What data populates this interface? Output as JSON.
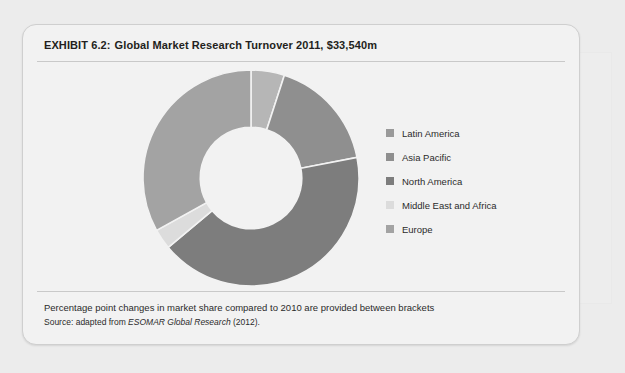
{
  "exhibit": {
    "label": "EXHIBIT 6.2:",
    "title": "Global Market Research Turnover 2011, $33,540m"
  },
  "legend": {
    "position": "right",
    "items": [
      {
        "label": "Latin America",
        "color": "#9a9a9a",
        "icon": "legend-swatch-icon"
      },
      {
        "label": "Asia Pacific",
        "color": "#8f8f8f",
        "icon": "legend-swatch-icon"
      },
      {
        "label": "North America",
        "color": "#7d7d7d",
        "icon": "legend-swatch-icon"
      },
      {
        "label": "Middle East and Africa",
        "color": "#dcdcdc",
        "icon": "legend-swatch-icon"
      },
      {
        "label": "Europe",
        "color": "#a3a3a3",
        "icon": "legend-swatch-icon"
      }
    ]
  },
  "footnotes": {
    "note": "Percentage point changes in market share compared to 2010 are provided between brackets",
    "source_prefix": "Source: adapted from ",
    "source_italic": "ESOMAR Global Research",
    "source_suffix": " (2012)."
  },
  "ghost_blocks": {
    "a": "",
    "b": "",
    "c": "",
    "d": "",
    "e": "",
    "f": ""
  },
  "chart_data": {
    "type": "pie",
    "variant": "donut",
    "title": "Global Market Research Turnover 2011, $33,540m",
    "total_label": "$33,540m",
    "inner_radius_ratio": 0.47,
    "start_angle_deg": 0,
    "direction": "clockwise",
    "grid": false,
    "legend_position": "right",
    "categories": [
      "Latin America",
      "Asia Pacific",
      "North America",
      "Middle East and Africa",
      "Europe"
    ],
    "values": [
      5,
      17,
      42,
      3,
      33
    ],
    "units": "percent of turnover",
    "colors": [
      "#b6b6b6",
      "#8f8f8f",
      "#7d7d7d",
      "#dcdcdc",
      "#a3a3a3"
    ],
    "slices": [
      {
        "name": "Latin America",
        "value": 5,
        "start_deg": 0,
        "end_deg": 18,
        "color": "#b6b6b6"
      },
      {
        "name": "Asia Pacific",
        "value": 17,
        "start_deg": 18,
        "end_deg": 79,
        "color": "#8f8f8f"
      },
      {
        "name": "North America",
        "value": 42,
        "start_deg": 79,
        "end_deg": 230,
        "color": "#7d7d7d"
      },
      {
        "name": "Middle East and Africa",
        "value": 3,
        "start_deg": 230,
        "end_deg": 241,
        "color": "#dcdcdc"
      },
      {
        "name": "Europe",
        "value": 33,
        "start_deg": 241,
        "end_deg": 360,
        "color": "#a3a3a3"
      }
    ]
  }
}
